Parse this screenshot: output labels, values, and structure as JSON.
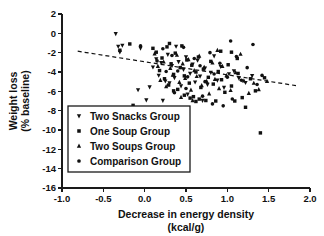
{
  "chart_data": {
    "type": "scatter",
    "title": "",
    "xlabel": "Decrease in energy density",
    "xlabel_units": "(kcal/g)",
    "ylabel": "Weight loss",
    "ylabel_units": "(% baseline)",
    "xlim": [
      -1.0,
      2.0
    ],
    "ylim": [
      -16,
      2
    ],
    "xticks": [
      "-1.0",
      "-0.5",
      "0.0",
      "0.5",
      "1.0",
      "1.5",
      "2.0"
    ],
    "xtick_values": [
      -1.0,
      -0.5,
      0.0,
      0.5,
      1.0,
      1.5,
      2.0
    ],
    "yticks": [
      "2",
      "0",
      "-2",
      "-4",
      "-6",
      "-8",
      "-10",
      "-12",
      "-14",
      "-16"
    ],
    "ytick_values": [
      2,
      0,
      -2,
      -4,
      -6,
      -8,
      -10,
      -12,
      -14,
      -16
    ],
    "grid": false,
    "legend_position": "lower-left-inside",
    "marker_color": "#111111",
    "trendline": {
      "style": "dashed",
      "x_start": -0.81,
      "y_start": -1.85,
      "x_end": 1.86,
      "y_end": -5.45
    },
    "series": [
      {
        "name": "Two Snacks Group",
        "marker": "triangle-down",
        "points": [
          [
            -0.35,
            -0.05
          ],
          [
            -0.32,
            -1.35
          ],
          [
            -0.3,
            -1.95
          ],
          [
            -0.27,
            -1.25
          ],
          [
            -0.08,
            -5.85
          ],
          [
            -0.05,
            -1.55
          ],
          [
            0.02,
            -6.9
          ],
          [
            0.06,
            -5.55
          ],
          [
            0.1,
            -3.5
          ],
          [
            0.14,
            -2.65
          ],
          [
            0.17,
            -4.35
          ],
          [
            0.2,
            -3.05
          ],
          [
            0.22,
            -6.95
          ],
          [
            0.25,
            -4.95
          ],
          [
            0.28,
            -2.2
          ],
          [
            0.3,
            -5.15
          ],
          [
            0.33,
            -3.35
          ],
          [
            0.36,
            -4.6
          ],
          [
            0.38,
            -1.35
          ],
          [
            0.41,
            -2.95
          ],
          [
            0.44,
            -5.45
          ],
          [
            0.47,
            -3.75
          ],
          [
            0.5,
            -2.45
          ],
          [
            0.52,
            -6.3
          ],
          [
            0.55,
            -4.15
          ],
          [
            0.58,
            -3.2
          ],
          [
            0.61,
            -5.05
          ],
          [
            0.64,
            -2.8
          ],
          [
            0.67,
            -4.45
          ],
          [
            0.7,
            -6.95
          ],
          [
            0.73,
            -3.6
          ],
          [
            0.76,
            -5.3
          ],
          [
            0.8,
            -4.05
          ],
          [
            0.84,
            -2.35
          ],
          [
            0.88,
            -4.85
          ],
          [
            0.92,
            -3.45
          ],
          [
            0.96,
            -5.6
          ],
          [
            1.02,
            -4.2
          ],
          [
            1.08,
            -3.9
          ],
          [
            1.14,
            -4.65
          ],
          [
            1.22,
            -5.1
          ],
          [
            1.3,
            -4.4
          ]
        ]
      },
      {
        "name": "One Soup Group",
        "marker": "square",
        "points": [
          [
            -0.3,
            -1.75
          ],
          [
            -0.18,
            -1.1
          ],
          [
            -0.14,
            -7.45
          ],
          [
            0.1,
            -1.55
          ],
          [
            0.14,
            -1.95
          ],
          [
            0.18,
            -3.85
          ],
          [
            0.21,
            -2.55
          ],
          [
            0.24,
            -4.7
          ],
          [
            0.27,
            -1.4
          ],
          [
            0.29,
            -5.35
          ],
          [
            0.32,
            -3.15
          ],
          [
            0.35,
            -4.25
          ],
          [
            0.37,
            -2.05
          ],
          [
            0.4,
            -5.8
          ],
          [
            0.43,
            -3.55
          ],
          [
            0.45,
            -1.3
          ],
          [
            0.48,
            -4.4
          ],
          [
            0.51,
            -2.75
          ],
          [
            0.54,
            -5.15
          ],
          [
            0.57,
            -3.3
          ],
          [
            0.59,
            -6.55
          ],
          [
            0.62,
            -4.0
          ],
          [
            0.65,
            -2.45
          ],
          [
            0.68,
            -5.6
          ],
          [
            0.71,
            -3.7
          ],
          [
            0.74,
            -6.95
          ],
          [
            0.77,
            -4.55
          ],
          [
            0.8,
            -2.9
          ],
          [
            0.83,
            -5.25
          ],
          [
            0.86,
            -7.0
          ],
          [
            0.89,
            -3.95
          ],
          [
            0.93,
            -4.8
          ],
          [
            0.97,
            -6.1
          ],
          [
            1.01,
            -3.25
          ],
          [
            1.05,
            -5.45
          ],
          [
            1.09,
            -7.0
          ],
          [
            1.13,
            -4.15
          ],
          [
            1.18,
            -6.65
          ],
          [
            1.22,
            -7.65
          ],
          [
            1.28,
            -4.7
          ],
          [
            1.34,
            -5.95
          ],
          [
            1.4,
            -10.3
          ],
          [
            1.45,
            -4.6
          ],
          [
            0.62,
            -7.05
          ],
          [
            0.66,
            -6.8
          ],
          [
            0.55,
            -6.7
          ],
          [
            0.48,
            -6.4
          ],
          [
            0.35,
            -5.95
          ],
          [
            1.05,
            -1.95
          ],
          [
            1.12,
            -2.6
          ],
          [
            0.92,
            -1.85
          ],
          [
            0.3,
            -1.05
          ]
        ]
      },
      {
        "name": "Two Soups Group",
        "marker": "triangle-up",
        "points": [
          [
            0.12,
            -2.1
          ],
          [
            0.16,
            -3.4
          ],
          [
            0.19,
            -4.85
          ],
          [
            0.23,
            -2.95
          ],
          [
            0.26,
            -5.5
          ],
          [
            0.31,
            -3.6
          ],
          [
            0.34,
            -4.3
          ],
          [
            0.39,
            -2.25
          ],
          [
            0.42,
            -5.05
          ],
          [
            0.46,
            -3.15
          ],
          [
            0.49,
            -4.65
          ],
          [
            0.53,
            -2.7
          ],
          [
            0.56,
            -5.85
          ],
          [
            0.6,
            -3.85
          ],
          [
            0.63,
            -4.45
          ],
          [
            0.66,
            -2.35
          ],
          [
            0.69,
            -5.4
          ],
          [
            0.72,
            -3.5
          ],
          [
            0.75,
            -4.95
          ],
          [
            0.78,
            -6.25
          ],
          [
            0.82,
            -3.05
          ],
          [
            0.85,
            -4.75
          ],
          [
            0.9,
            -5.7
          ],
          [
            0.94,
            -3.4
          ],
          [
            0.99,
            -4.35
          ],
          [
            1.04,
            -5.9
          ],
          [
            1.1,
            -4.05
          ],
          [
            1.16,
            -2.15
          ],
          [
            1.2,
            -4.9
          ],
          [
            1.26,
            -6.2
          ],
          [
            1.32,
            -5.15
          ],
          [
            1.38,
            -5.8
          ],
          [
            0.58,
            -6.95
          ],
          [
            0.44,
            -6.6
          ],
          [
            1.48,
            -4.95
          ],
          [
            0.88,
            -1.75
          ]
        ]
      },
      {
        "name": "Comparison Group",
        "marker": "circle",
        "points": [
          [
            -0.05,
            -1.3
          ],
          [
            0.15,
            -2.85
          ],
          [
            0.22,
            -1.6
          ],
          [
            0.33,
            -2.3
          ],
          [
            0.4,
            -3.9
          ],
          [
            0.47,
            -1.45
          ],
          [
            0.52,
            -4.5
          ],
          [
            0.6,
            -2.6
          ],
          [
            0.67,
            -3.35
          ],
          [
            0.73,
            -5.0
          ],
          [
            0.79,
            -2.0
          ],
          [
            0.84,
            -4.2
          ],
          [
            0.91,
            -3.1
          ],
          [
            0.95,
            -7.5
          ],
          [
            1.0,
            -4.55
          ],
          [
            1.04,
            -0.8
          ],
          [
            1.11,
            -2.4
          ],
          [
            1.17,
            -4.85
          ],
          [
            1.24,
            -3.55
          ],
          [
            1.31,
            -1.15
          ],
          [
            1.36,
            -5.3
          ],
          [
            0.7,
            -6.5
          ],
          [
            0.5,
            -5.7
          ],
          [
            0.36,
            -6.15
          ],
          [
            0.26,
            -3.95
          ],
          [
            0.82,
            -7.3
          ],
          [
            1.06,
            -6.8
          ],
          [
            1.42,
            -4.35
          ]
        ]
      }
    ]
  },
  "legend": {
    "items": [
      {
        "label": "Two Snacks Group",
        "marker": "triangle-down"
      },
      {
        "label": "One Soup Group",
        "marker": "square"
      },
      {
        "label": "Two Soups Group",
        "marker": "triangle-up"
      },
      {
        "label": "Comparison Group",
        "marker": "circle"
      }
    ]
  }
}
